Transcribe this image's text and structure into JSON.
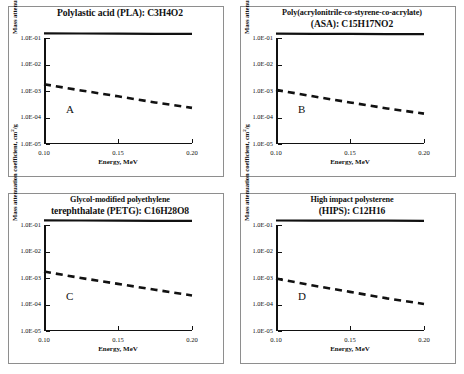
{
  "figure": {
    "axis_label_x": "Energy, MeV",
    "axis_label_y_pre": "Mass attenuation coefficient, cm",
    "axis_label_y_sup": "2",
    "axis_label_y_post": "/g",
    "xticks": [
      "0.10",
      "0.15",
      "0.20"
    ],
    "yticks": [
      "1.0E-01",
      "1.0E-02",
      "1.0E-03",
      "1.0E-04",
      "1.0E-05"
    ],
    "colors": {
      "line": "#111111",
      "frame": "#8e8e8e",
      "background": "#ffffff"
    }
  },
  "panels": [
    {
      "letter": "A",
      "title_lines": [
        "Polylastic acid (PLA): C3H4O2"
      ],
      "title_big_index": 0,
      "material": "Polylastic acid",
      "abbreviation": "PLA",
      "formula": "C3H4O2"
    },
    {
      "letter": "B",
      "title_lines": [
        "Poly(acrylonitrile-co-styrene-co-acrylate)",
        "(ASA): C15H17NO2"
      ],
      "title_big_index": 1,
      "material": "Poly(acrylonitrile-co-styrene-co-acrylate)",
      "abbreviation": "ASA",
      "formula": "C15H17NO2"
    },
    {
      "letter": "C",
      "title_lines": [
        "Glycol-modified polyethylene",
        "terephthalate (PETG): C16H28O8"
      ],
      "title_big_index": 1,
      "material": "Glycol-modified polyethylene terephthalate",
      "abbreviation": "PETG",
      "formula": "C16H28O8"
    },
    {
      "letter": "D",
      "title_lines": [
        "High impact polysterene",
        "(HIPS): C12H16"
      ],
      "title_big_index": 1,
      "material": "High impact polysterene",
      "abbreviation": "HIPS",
      "formula": "C12H16"
    }
  ],
  "chart_data": [
    {
      "type": "line",
      "title": "Polylastic acid (PLA): C3H4O2",
      "panel": "A",
      "xlabel": "Energy, MeV",
      "ylabel": "Mass attenuation coefficient, cm2/g",
      "xlim": [
        0.1,
        0.2
      ],
      "ylim": [
        1e-05,
        0.1
      ],
      "yscale": "log",
      "grid": false,
      "legend": "none",
      "x": [
        0.1,
        0.125,
        0.15,
        0.175,
        0.2
      ],
      "series": [
        {
          "name": "Total mass attenuation coefficient",
          "style": "solid",
          "values": [
            0.15,
            0.148,
            0.146,
            0.144,
            0.142
          ]
        },
        {
          "name": "Photoelectric / partial interaction coefficient",
          "style": "dashed",
          "values": [
            0.0018,
            0.00105,
            0.00063,
            0.00037,
            0.00023
          ]
        }
      ]
    },
    {
      "type": "line",
      "title": "Poly(acrylonitrile-co-styrene-co-acrylate) (ASA): C15H17NO2",
      "panel": "B",
      "xlabel": "Energy, MeV",
      "ylabel": "Mass attenuation coefficient, cm2/g",
      "xlim": [
        0.1,
        0.2
      ],
      "ylim": [
        1e-05,
        0.1
      ],
      "yscale": "log",
      "grid": false,
      "legend": "none",
      "x": [
        0.1,
        0.125,
        0.15,
        0.175,
        0.2
      ],
      "series": [
        {
          "name": "Total mass attenuation coefficient",
          "style": "solid",
          "values": [
            0.145,
            0.144,
            0.143,
            0.141,
            0.14
          ]
        },
        {
          "name": "Photoelectric / partial interaction coefficient",
          "style": "dashed",
          "values": [
            0.0011,
            0.00063,
            0.00037,
            0.00022,
            0.00014
          ]
        }
      ]
    },
    {
      "type": "line",
      "title": "Glycol-modified polyethylene terephthalate (PETG): C16H28O8",
      "panel": "C",
      "xlabel": "Energy, MeV",
      "ylabel": "Mass attenuation coefficient, cm2/g",
      "xlim": [
        0.1,
        0.2
      ],
      "ylim": [
        1e-05,
        0.1
      ],
      "yscale": "log",
      "grid": false,
      "legend": "none",
      "x": [
        0.1,
        0.125,
        0.15,
        0.175,
        0.2
      ],
      "series": [
        {
          "name": "Total mass attenuation coefficient",
          "style": "solid",
          "values": [
            0.15,
            0.148,
            0.146,
            0.144,
            0.142
          ]
        },
        {
          "name": "Photoelectric / partial interaction coefficient",
          "style": "dashed",
          "values": [
            0.00175,
            0.001,
            0.0006,
            0.00036,
            0.00022
          ]
        }
      ]
    },
    {
      "type": "line",
      "title": "High impact polysterene (HIPS): C12H16",
      "panel": "D",
      "xlabel": "Energy, MeV",
      "ylabel": "Mass attenuation coefficient, cm2/g",
      "xlim": [
        0.1,
        0.2
      ],
      "ylim": [
        1e-05,
        0.1
      ],
      "yscale": "log",
      "grid": false,
      "legend": "none",
      "x": [
        0.1,
        0.125,
        0.15,
        0.175,
        0.2
      ],
      "series": [
        {
          "name": "Total mass attenuation coefficient",
          "style": "solid",
          "values": [
            0.148,
            0.147,
            0.146,
            0.145,
            0.144
          ]
        },
        {
          "name": "Photoelectric / partial interaction coefficient",
          "style": "dashed",
          "values": [
            0.00095,
            0.00052,
            0.0003,
            0.00017,
            0.000105
          ]
        }
      ]
    }
  ]
}
